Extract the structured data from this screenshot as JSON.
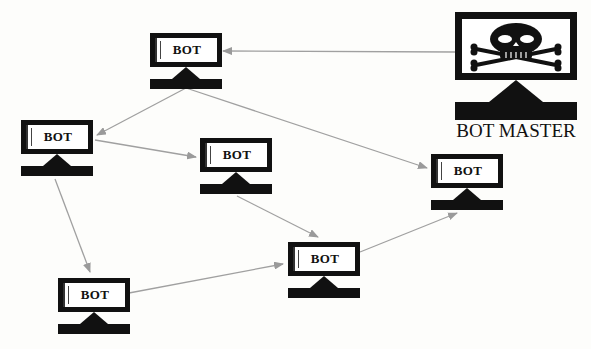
{
  "diagram": {
    "type": "botnet-topology",
    "colors": {
      "background": "#fdfdfb",
      "node": "#111111",
      "edge": "#a0a0a0"
    },
    "master": {
      "label": "BOT MASTER",
      "icon": "skull-crossbones-icon"
    },
    "bots": [
      {
        "id": "bot1",
        "label": "BOT"
      },
      {
        "id": "bot2",
        "label": "BOT"
      },
      {
        "id": "bot3",
        "label": "BOT"
      },
      {
        "id": "bot4",
        "label": "BOT"
      },
      {
        "id": "bot5",
        "label": "BOT"
      },
      {
        "id": "bot6",
        "label": "BOT"
      }
    ],
    "edges": [
      {
        "from": "master",
        "to": "bot1"
      },
      {
        "from": "bot1",
        "to": "bot2"
      },
      {
        "from": "bot1",
        "to": "bot4"
      },
      {
        "from": "bot2",
        "to": "bot3"
      },
      {
        "from": "bot2",
        "to": "bot6"
      },
      {
        "from": "bot3",
        "to": "bot5"
      },
      {
        "from": "bot6",
        "to": "bot5"
      },
      {
        "from": "bot5",
        "to": "bot4"
      }
    ]
  }
}
